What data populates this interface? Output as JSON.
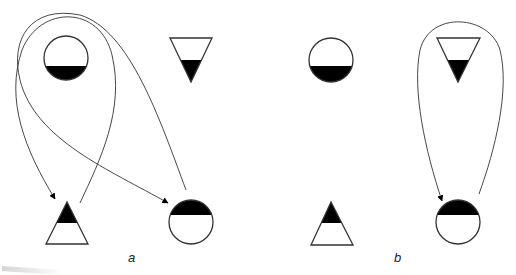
{
  "panels": [
    {
      "id": "a",
      "label": "a",
      "symbols": [
        {
          "type": "circle",
          "fill": "bottom",
          "cx": 66,
          "cy": 58,
          "r": 22,
          "split_y": 66
        },
        {
          "type": "triangle-down",
          "fill": "bottom",
          "top_y": 38,
          "left_x": 170,
          "right_x": 212,
          "tip_x": 191,
          "tip_y": 82,
          "split_y": 60
        },
        {
          "type": "triangle-up",
          "fill": "top",
          "apex_x": 67,
          "apex_y": 202,
          "base_y": 244,
          "left_x": 46,
          "right_x": 88,
          "split_y": 223
        },
        {
          "type": "circle",
          "fill": "top",
          "cx": 191,
          "cy": 222,
          "r": 22,
          "split_y": 215
        }
      ],
      "arrows": [
        {
          "from": "triangle-up-right",
          "to": "triangle-up",
          "path": "M80,203 C100,160 125,110 112,55 C100,5 40,5 22,50 C5,100 25,150 55,199"
        },
        {
          "from": "circle-bottom",
          "to": "circle-bottom-left",
          "path": "M186,190 C160,120 130,30 80,15 C30,5 10,40 20,80 C35,140 110,170 168,203"
        }
      ]
    },
    {
      "id": "b",
      "label": "b",
      "symbols": [
        {
          "type": "circle",
          "fill": "bottom",
          "cx": 331,
          "cy": 60,
          "r": 22,
          "split_y": 66
        },
        {
          "type": "triangle-down",
          "fill": "bottom",
          "top_y": 38,
          "left_x": 437,
          "right_x": 480,
          "tip_x": 458,
          "tip_y": 82,
          "split_y": 60
        },
        {
          "type": "triangle-up",
          "fill": "top",
          "apex_x": 331,
          "apex_y": 202,
          "base_y": 245,
          "left_x": 311,
          "right_x": 353,
          "split_y": 223
        },
        {
          "type": "circle",
          "fill": "top",
          "cx": 458,
          "cy": 222,
          "r": 22,
          "split_y": 215
        }
      ],
      "arrows": [
        {
          "from": "circle-bottom-right",
          "to": "circle-bottom-left",
          "path": "M479,194 C495,150 510,90 500,50 C490,15 430,10 420,50 C412,90 425,150 442,201"
        }
      ]
    }
  ],
  "colors": {
    "stroke": "#333333",
    "fill": "#000000",
    "background": "#ffffff"
  }
}
